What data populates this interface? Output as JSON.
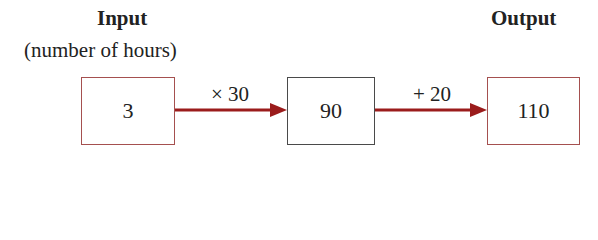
{
  "labels": {
    "input_title": "Input",
    "input_subtitle": "(number of hours)",
    "output_title": "Output"
  },
  "nodes": [
    {
      "id": "input",
      "value": "3",
      "border_color": "#a5504f"
    },
    {
      "id": "middle",
      "value": "90",
      "border_color": "#4a4a4a"
    },
    {
      "id": "output",
      "value": "110",
      "border_color": "#a5504f"
    }
  ],
  "edges": [
    {
      "from": "input",
      "to": "middle",
      "operation": "× 30"
    },
    {
      "from": "middle",
      "to": "output",
      "operation": "+ 20"
    }
  ],
  "colors": {
    "arrow": "#9b1c1c",
    "red_box_border": "#a5504f",
    "dark_box_border": "#4a4a4a",
    "text": "#222222"
  }
}
